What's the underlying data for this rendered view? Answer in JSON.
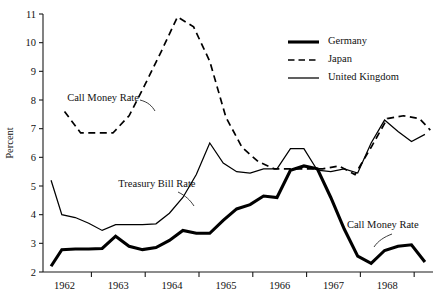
{
  "chart_data": {
    "type": "line",
    "title": "",
    "subtitle": "",
    "xlabel": "",
    "ylabel": "Percent",
    "ylim": [
      2,
      11
    ],
    "xlim": [
      1961.6,
      1968.85
    ],
    "grid": false,
    "legend_position": "top-right",
    "ytick_labels": [
      "2",
      "3",
      "4",
      "5",
      "6",
      "7",
      "8",
      "9",
      "10",
      "11"
    ],
    "ytick_values": [
      2,
      3,
      4,
      5,
      6,
      7,
      8,
      9,
      10,
      11
    ],
    "xtick_labels": [
      "1962",
      "1963",
      "1964",
      "1965",
      "1966",
      "1967",
      "1968"
    ],
    "xtick_values": [
      1962,
      1963,
      1964,
      1965,
      1966,
      1967,
      1968
    ],
    "legend": [
      {
        "name": "Germany",
        "style": "thick-solid"
      },
      {
        "name": "Japan",
        "style": "dashed"
      },
      {
        "name": "United Kingdom",
        "style": "thin-solid"
      }
    ],
    "annotations": [
      {
        "text": "Call Money Rate",
        "series": "Japan",
        "x": 1962.05,
        "y": 7.95
      },
      {
        "text": "Treasury Bill Rate",
        "series": "United Kingdom",
        "x": 1963.0,
        "y": 4.95
      },
      {
        "text": "Call Money Rate",
        "series": "Germany",
        "x": 1967.25,
        "y": 3.55
      }
    ],
    "series": [
      {
        "name": "Germany",
        "x": [
          1961.75,
          1961.95,
          1962.2,
          1962.45,
          1962.7,
          1962.95,
          1963.2,
          1963.45,
          1963.7,
          1963.95,
          1964.2,
          1964.45,
          1964.7,
          1964.95,
          1965.2,
          1965.45,
          1965.7,
          1965.95,
          1966.2,
          1966.45,
          1966.7,
          1966.95,
          1967.2,
          1967.45,
          1967.7,
          1967.95,
          1968.2,
          1968.45,
          1968.7
        ],
        "y": [
          2.2,
          2.78,
          2.8,
          2.8,
          2.82,
          3.25,
          2.9,
          2.78,
          2.85,
          3.1,
          3.45,
          3.35,
          3.35,
          3.8,
          4.2,
          4.35,
          4.65,
          4.6,
          5.55,
          5.7,
          5.6,
          4.6,
          3.5,
          2.55,
          2.3,
          2.75,
          2.9,
          2.95,
          2.35
        ]
      },
      {
        "name": "Japan",
        "x": [
          1962.0,
          1962.3,
          1962.6,
          1962.9,
          1963.2,
          1963.5,
          1963.8,
          1964.1,
          1964.4,
          1964.7,
          1965.0,
          1965.3,
          1965.6,
          1965.9,
          1966.2,
          1966.5,
          1966.8,
          1967.1,
          1967.4,
          1967.7,
          1968.0,
          1968.3,
          1968.6,
          1968.8
        ],
        "y": [
          7.6,
          6.85,
          6.85,
          6.85,
          7.45,
          8.55,
          9.7,
          10.9,
          10.55,
          9.35,
          7.4,
          6.35,
          5.85,
          5.6,
          5.6,
          5.6,
          5.6,
          5.7,
          5.4,
          6.35,
          7.35,
          7.45,
          7.35,
          6.95
        ]
      },
      {
        "name": "United Kingdom",
        "x": [
          1961.75,
          1961.95,
          1962.2,
          1962.45,
          1962.7,
          1962.95,
          1963.2,
          1963.45,
          1963.7,
          1963.95,
          1964.2,
          1964.45,
          1964.7,
          1964.95,
          1965.2,
          1965.45,
          1965.7,
          1965.95,
          1966.2,
          1966.45,
          1966.7,
          1966.95,
          1967.2,
          1967.45,
          1967.7,
          1967.95,
          1968.2,
          1968.45,
          1968.7
        ],
        "y": [
          5.2,
          4.0,
          3.9,
          3.7,
          3.45,
          3.65,
          3.65,
          3.65,
          3.68,
          4.05,
          4.6,
          5.4,
          6.5,
          5.8,
          5.5,
          5.45,
          5.6,
          5.6,
          6.3,
          6.3,
          5.55,
          5.5,
          5.6,
          5.45,
          6.5,
          7.3,
          6.9,
          6.55,
          6.8
        ]
      }
    ]
  }
}
